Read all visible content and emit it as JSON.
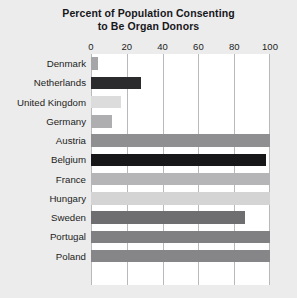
{
  "chart_data": {
    "type": "bar",
    "orientation": "horizontal",
    "title": "Percent of Population Consenting to Be Organ Donors",
    "title_lines": [
      "Percent of Population Consenting",
      "to Be Organ Donors"
    ],
    "xlabel": "",
    "ylabel": "",
    "xlim": [
      0,
      100
    ],
    "xticks": [
      0,
      20,
      40,
      60,
      80,
      100
    ],
    "xtick_labels": [
      "0",
      "20",
      "40",
      "60",
      "80",
      "100"
    ],
    "grid": "vertical",
    "legend": "none",
    "categories": [
      "Denmark",
      "Netherlands",
      "United Kingdom",
      "Germany",
      "Austria",
      "Belgium",
      "France",
      "Hungary",
      "Sweden",
      "Portugal",
      "Poland"
    ],
    "values": [
      4,
      28,
      17,
      12,
      100,
      98,
      100,
      100,
      86,
      100,
      100
    ],
    "bar_colors": [
      "#a6a6a8",
      "#2b2b2d",
      "#dcdcdd",
      "#aeaeb0",
      "#8f8f91",
      "#17171a",
      "#b5b5b7",
      "#d4d4d5",
      "#6e6e70",
      "#808082",
      "#868688"
    ]
  },
  "style": {
    "page_background": "#ececed",
    "plot_background": "#ffffff",
    "gridline_color": "#b9b9bb",
    "text_color": "#1d1d20"
  }
}
